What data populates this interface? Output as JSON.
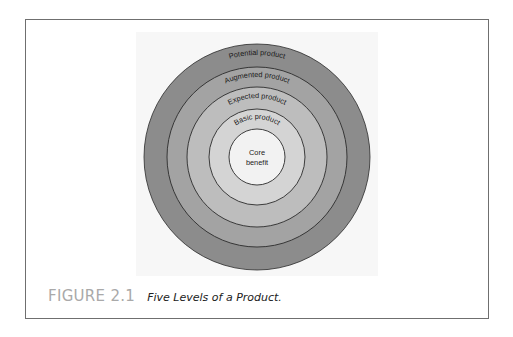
{
  "figure": {
    "number": "FIGURE 2.1",
    "title": "Five Levels of a Product."
  },
  "diagram": {
    "type": "concentric-circles",
    "center": [
      231,
      137
    ],
    "levels": [
      {
        "label": "Potential product",
        "radius": 113,
        "fill": "#8c8c8c"
      },
      {
        "label": "Augmented product",
        "radius": 90,
        "fill": "#a3a3a3"
      },
      {
        "label": "Expected product",
        "radius": 70,
        "fill": "#bdbdbd"
      },
      {
        "label": "Basic product",
        "radius": 48,
        "fill": "#d4d4d4"
      },
      {
        "label": "Core benefit",
        "label_lines": [
          "Core",
          "benefit"
        ],
        "radius": 28,
        "fill": "#f2f2f2"
      }
    ],
    "stroke_color": "#2b2b2b"
  },
  "colors": {
    "frame_border": "#6f6f6f",
    "figure_number": "#a9a9a9",
    "figure_title": "#222222"
  }
}
